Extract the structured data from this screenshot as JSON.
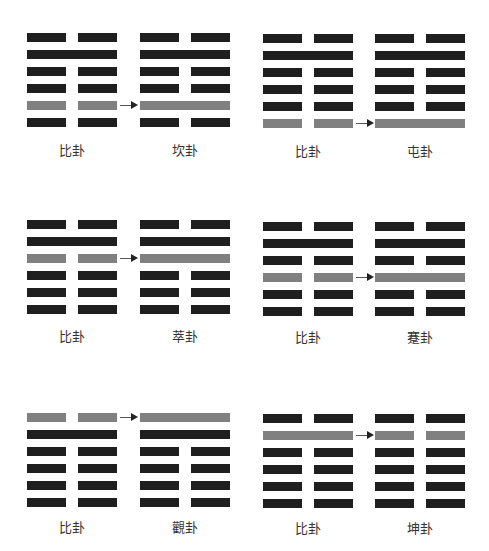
{
  "colors": {
    "line": "#1f1f1f",
    "changed_line": "#808080",
    "background": "#ffffff"
  },
  "line_legend": {
    "Y": "yang (solid)",
    "N": "yin (broken)"
  },
  "panels": [
    {
      "from": {
        "label": "比卦",
        "lines": [
          "N",
          "Y",
          "N",
          "N",
          "N",
          "N"
        ]
      },
      "to": {
        "label": "坎卦",
        "lines": [
          "N",
          "Y",
          "N",
          "N",
          "Y",
          "N"
        ]
      },
      "changed_index": 4
    },
    {
      "from": {
        "label": "比卦",
        "lines": [
          "N",
          "Y",
          "N",
          "N",
          "N",
          "N"
        ]
      },
      "to": {
        "label": "屯卦",
        "lines": [
          "N",
          "Y",
          "N",
          "N",
          "N",
          "Y"
        ]
      },
      "changed_index": 5
    },
    {
      "from": {
        "label": "比卦",
        "lines": [
          "N",
          "Y",
          "N",
          "N",
          "N",
          "N"
        ]
      },
      "to": {
        "label": "萃卦",
        "lines": [
          "N",
          "Y",
          "Y",
          "N",
          "N",
          "N"
        ]
      },
      "changed_index": 2
    },
    {
      "from": {
        "label": "比卦",
        "lines": [
          "N",
          "Y",
          "N",
          "N",
          "N",
          "N"
        ]
      },
      "to": {
        "label": "蹇卦",
        "lines": [
          "N",
          "Y",
          "N",
          "Y",
          "N",
          "N"
        ]
      },
      "changed_index": 3
    },
    {
      "from": {
        "label": "比卦",
        "lines": [
          "N",
          "Y",
          "N",
          "N",
          "N",
          "N"
        ]
      },
      "to": {
        "label": "觀卦",
        "lines": [
          "Y",
          "Y",
          "N",
          "N",
          "N",
          "N"
        ]
      },
      "changed_index": 0
    },
    {
      "from": {
        "label": "比卦",
        "lines": [
          "N",
          "Y",
          "N",
          "N",
          "N",
          "N"
        ]
      },
      "to": {
        "label": "坤卦",
        "lines": [
          "N",
          "N",
          "N",
          "N",
          "N",
          "N"
        ]
      },
      "changed_index": 1
    }
  ]
}
